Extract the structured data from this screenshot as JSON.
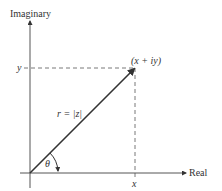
{
  "diagram": {
    "axes": {
      "vertical_label": "Imaginary",
      "horizontal_label": "Real"
    },
    "point_label": "(x + iy)",
    "vector_label": "r = |z|",
    "angle_label": "θ",
    "x_tick_label": "x",
    "y_tick_label": "y"
  }
}
